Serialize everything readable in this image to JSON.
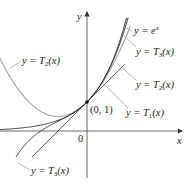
{
  "figure": {
    "axes": {
      "x_label": "x",
      "y_label": "y",
      "origin_label": "0",
      "point_label": "(0, 1)"
    },
    "labels": {
      "exp": {
        "prefix": "y = e",
        "sup": "x"
      },
      "t3_upper": {
        "prefix": "y = T",
        "sub": "3",
        "suffix": "(x)"
      },
      "t2_left": {
        "prefix": "y = T",
        "sub": "2",
        "suffix": "(x)"
      },
      "t2_right": {
        "prefix": "y = T",
        "sub": "2",
        "suffix": "(x)"
      },
      "t1": {
        "prefix": "y = T",
        "sub": "1",
        "suffix": "(x)"
      },
      "t3_lower": {
        "prefix": "y = T",
        "sub": "3",
        "suffix": "(x)"
      }
    },
    "colors": {
      "curve_black": "#2a2a2a",
      "curve_gray": "#a8a8a8",
      "axis": "#555555",
      "leader": "#9a9a9a"
    }
  },
  "chart_data": {
    "type": "line",
    "title": "",
    "xlabel": "x",
    "ylabel": "y",
    "grid": false,
    "origin_px": [
      87,
      131
    ],
    "scale_px_per_unit": 29,
    "series": [
      {
        "name": "y = e^x",
        "function": "exp",
        "x_range": [
          -3.0,
          1.36
        ],
        "color": "#2a2a2a"
      },
      {
        "name": "y = T3(x)",
        "function": "1+x+x^2/2+x^3/6",
        "x_range": [
          -2.45,
          1.42
        ],
        "color": "#2a2a2a"
      },
      {
        "name": "y = T2(x)",
        "function": "1+x+x^2/2",
        "x_range": [
          -3.0,
          1.5
        ],
        "color": "#a8a8a8"
      },
      {
        "name": "y = T1(x)",
        "function": "1+x",
        "x_range": [
          -1.9,
          1.3
        ],
        "color": "#2a2a2a"
      }
    ],
    "points": [
      {
        "x": 0,
        "y": 1,
        "label": "(0, 1)"
      }
    ]
  }
}
